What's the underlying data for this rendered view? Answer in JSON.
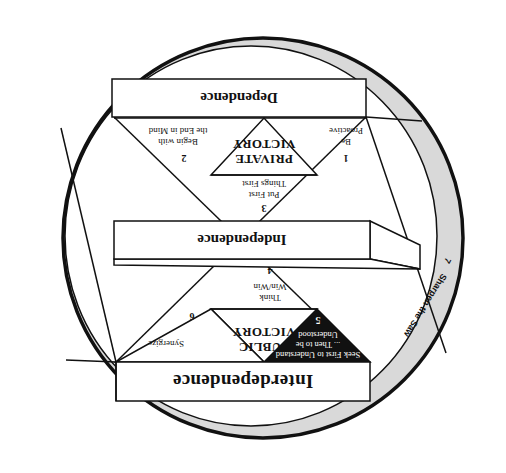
{
  "diagram": {
    "orientation_degrees": 180,
    "colors": {
      "line": "#111111",
      "ring_fill": "#d9d9d9",
      "background": "#ffffff",
      "habit5_fill": "#111111"
    },
    "stages": {
      "dependence": "Dependence",
      "independence": "Independence",
      "interdependence": "Interdependence"
    },
    "victories": {
      "private_line1": "PRIVATE",
      "private_line2": "VICTORY",
      "public_line1": "PUBLIC",
      "public_line2": "VICTORY"
    },
    "habits": [
      {
        "number": "1",
        "line1": "Be",
        "line2": "Proactive"
      },
      {
        "number": "2",
        "line1": "Begin with",
        "line2": "the End in Mind"
      },
      {
        "number": "3",
        "line1": "Put First",
        "line2": "Things First"
      },
      {
        "number": "4",
        "line1": "Think",
        "line2": "Win/Win"
      },
      {
        "number": "5",
        "line1": "Seek First to Understand",
        "line2": "... Then to be",
        "line3": "Understood"
      },
      {
        "number": "6",
        "line1": "Synergize",
        "line2": ""
      },
      {
        "number": "7",
        "line1": "Sharpen the Saw",
        "line2": ""
      }
    ]
  }
}
